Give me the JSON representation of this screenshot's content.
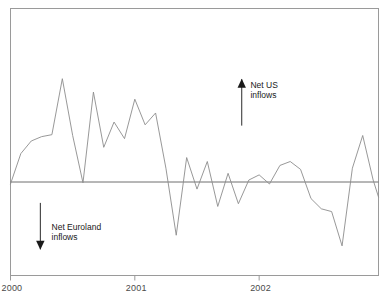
{
  "chart_data": {
    "type": "line",
    "title": "",
    "subtitle": "",
    "xlabel": "",
    "ylabel": "",
    "grid": false,
    "legend_position": "none",
    "zero_line": true,
    "xlim": [
      2000.0,
      2002.96
    ],
    "ylim": [
      -2.4,
      4.4
    ],
    "x_tick_labels": [
      "2000",
      "2001",
      "2002"
    ],
    "x_tick_values": [
      2000,
      2001,
      2002
    ],
    "series": [
      {
        "name": "Net US inflows minus net Euroland inflows",
        "color": "#8c8c8c",
        "x": [
          2000.0,
          2000.083,
          2000.167,
          2000.25,
          2000.333,
          2000.417,
          2000.5,
          2000.583,
          2000.667,
          2000.75,
          2000.833,
          2000.917,
          2001.0,
          2001.083,
          2001.167,
          2001.25,
          2001.333,
          2001.417,
          2001.5,
          2001.583,
          2001.667,
          2001.75,
          2001.833,
          2001.917,
          2002.0,
          2002.083,
          2002.167,
          2002.25,
          2002.333,
          2002.417,
          2002.5,
          2002.583,
          2002.667,
          2002.75,
          2002.833,
          2002.917,
          2002.96
        ],
        "values": [
          -0.05,
          0.72,
          1.04,
          1.15,
          1.2,
          2.62,
          1.18,
          -0.02,
          2.28,
          0.88,
          1.52,
          1.1,
          2.1,
          1.45,
          1.75,
          0.35,
          -1.35,
          0.62,
          -0.18,
          0.52,
          -0.62,
          0.22,
          -0.55,
          0.05,
          0.18,
          -0.05,
          0.42,
          0.52,
          0.32,
          -0.42,
          -0.68,
          -0.75,
          -1.62,
          0.35,
          1.18,
          0.05,
          -0.38
        ]
      }
    ],
    "annotations": [
      {
        "name": "net-us-inflows",
        "lines": [
          "Net US",
          "inflows"
        ],
        "arrow": "up",
        "arrow_x": 2001.86,
        "arrow_tip_y": 2.62,
        "arrow_tail_y": 1.43,
        "text_x": 2001.93,
        "text_y": 2.45
      },
      {
        "name": "net-euroland-inflows",
        "lines": [
          "Net Euroland",
          "inflows"
        ],
        "arrow": "down",
        "arrow_x": 2000.24,
        "arrow_tip_y": -1.72,
        "arrow_tail_y": -0.53,
        "text_x": 2000.33,
        "text_y": -1.14
      }
    ],
    "frame": {
      "border_color": "#9a9a9a",
      "zero_line_color": "#6e6e6e"
    }
  }
}
